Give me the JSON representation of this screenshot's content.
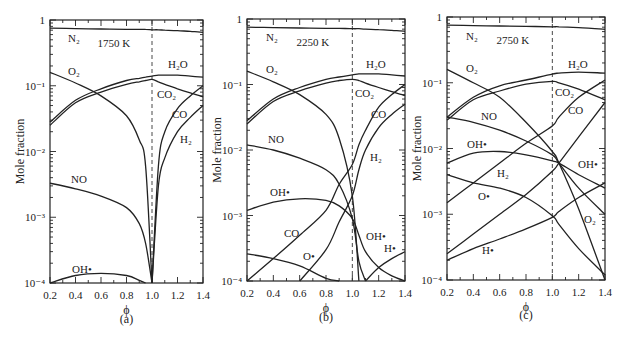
{
  "figure": {
    "ylabel": "Mole fraction",
    "xlabel": "ϕ",
    "yticks": [
      "1",
      "10⁻¹",
      "10⁻²",
      "10⁻³",
      "10⁻⁴"
    ],
    "xticks": [
      "0.2",
      "0.4",
      "0.6",
      "0.8",
      "1.0",
      "1.2",
      "1.4"
    ]
  },
  "chart_data": [
    {
      "type": "line",
      "panel": "(a)",
      "annotation": "1750 K",
      "xlabel": "ϕ",
      "ylabel": "Mole fraction",
      "xlim": [
        0.2,
        1.4
      ],
      "ylim": [
        0.0001,
        1
      ],
      "yscale": "log",
      "vline": 1.0,
      "x": [
        0.2,
        0.4,
        0.6,
        0.8,
        0.9,
        0.95,
        1.0,
        1.05,
        1.1,
        1.2,
        1.3,
        1.4
      ],
      "series": [
        {
          "name": "N2",
          "values": [
            0.75,
            0.74,
            0.73,
            0.72,
            0.72,
            0.72,
            0.71,
            0.71,
            0.7,
            0.69,
            0.67,
            0.65
          ]
        },
        {
          "name": "O2",
          "values": [
            0.16,
            0.11,
            0.07,
            0.035,
            0.015,
            0.006,
            0.0001,
            null,
            null,
            null,
            null,
            null
          ]
        },
        {
          "name": "H2O",
          "values": [
            0.028,
            0.06,
            0.09,
            0.12,
            0.13,
            0.135,
            0.14,
            0.145,
            0.145,
            0.145,
            0.14,
            0.135
          ]
        },
        {
          "name": "CO2",
          "values": [
            0.025,
            0.055,
            0.08,
            0.105,
            0.115,
            0.12,
            0.125,
            0.115,
            0.105,
            0.09,
            0.078,
            0.068
          ]
        },
        {
          "name": "CO",
          "values": [
            null,
            null,
            null,
            null,
            null,
            null,
            0.0001,
            0.006,
            0.02,
            0.045,
            0.07,
            0.1
          ]
        },
        {
          "name": "H2",
          "values": [
            null,
            null,
            null,
            null,
            null,
            null,
            0.0001,
            0.003,
            0.008,
            0.02,
            0.033,
            0.05
          ]
        },
        {
          "name": "NO",
          "values": [
            0.0033,
            0.0027,
            0.0021,
            0.0014,
            0.0008,
            0.0004,
            0.0001,
            null,
            null,
            null,
            null,
            null
          ]
        },
        {
          "name": "OH•",
          "values": [
            0.0001,
            0.00013,
            0.00014,
            0.00013,
            0.00011,
            0.0001,
            null,
            null,
            null,
            null,
            null,
            null
          ]
        }
      ]
    },
    {
      "type": "line",
      "panel": "(b)",
      "annotation": "2250 K",
      "xlabel": "ϕ",
      "ylabel": "Mole fraction",
      "xlim": [
        0.2,
        1.4
      ],
      "ylim": [
        0.0001,
        1
      ],
      "yscale": "log",
      "vline": 1.0,
      "x": [
        0.2,
        0.4,
        0.6,
        0.8,
        0.9,
        1.0,
        1.05,
        1.1,
        1.2,
        1.3,
        1.4
      ],
      "series": [
        {
          "name": "N2",
          "values": [
            0.75,
            0.74,
            0.73,
            0.72,
            0.72,
            0.71,
            0.71,
            0.7,
            0.69,
            0.67,
            0.65
          ]
        },
        {
          "name": "O2",
          "values": [
            0.16,
            0.11,
            0.07,
            0.035,
            0.015,
            0.002,
            0.0001,
            null,
            null,
            null,
            null
          ]
        },
        {
          "name": "H2O",
          "values": [
            0.028,
            0.06,
            0.09,
            0.12,
            0.13,
            0.14,
            0.145,
            0.145,
            0.145,
            0.14,
            0.135
          ]
        },
        {
          "name": "CO2",
          "values": [
            0.025,
            0.055,
            0.08,
            0.105,
            0.115,
            0.12,
            0.115,
            0.105,
            0.09,
            0.078,
            0.068
          ]
        },
        {
          "name": "CO",
          "values": [
            0.0001,
            0.00022,
            0.0005,
            0.0012,
            0.003,
            0.006,
            0.012,
            0.02,
            0.045,
            0.07,
            0.1
          ]
        },
        {
          "name": "H2",
          "values": [
            null,
            null,
            0.0001,
            0.0003,
            0.0008,
            0.002,
            0.005,
            0.01,
            0.022,
            0.035,
            0.05
          ]
        },
        {
          "name": "NO",
          "values": [
            0.012,
            0.01,
            0.0075,
            0.005,
            0.003,
            0.0009,
            0.0002,
            0.0001,
            null,
            null,
            null
          ]
        },
        {
          "name": "OH•",
          "values": [
            0.0012,
            0.0016,
            0.0018,
            0.0017,
            0.0014,
            0.0009,
            0.0005,
            0.00028,
            0.00016,
            0.00012,
            0.0001
          ]
        },
        {
          "name": "O•",
          "values": [
            0.00026,
            0.00022,
            0.00017,
            0.00011,
            8e-05,
            null,
            null,
            null,
            null,
            null,
            null
          ]
        },
        {
          "name": "H•",
          "values": [
            null,
            null,
            null,
            null,
            null,
            null,
            null,
            0.0001,
            0.00016,
            0.00022,
            0.00028
          ]
        }
      ]
    },
    {
      "type": "line",
      "panel": "(c)",
      "annotation": "2750 K",
      "xlabel": "ϕ",
      "ylabel": "Mole fraction",
      "xlim": [
        0.2,
        1.4
      ],
      "ylim": [
        0.0001,
        1
      ],
      "yscale": "log",
      "vline": 1.0,
      "x": [
        0.2,
        0.4,
        0.6,
        0.8,
        1.0,
        1.05,
        1.2,
        1.4
      ],
      "series": [
        {
          "name": "N2",
          "values": [
            0.75,
            0.74,
            0.73,
            0.72,
            0.71,
            0.71,
            0.69,
            0.65
          ]
        },
        {
          "name": "O2",
          "values": [
            0.16,
            0.1,
            0.06,
            0.025,
            0.009,
            0.006,
            0.0012,
            0.0001
          ]
        },
        {
          "name": "H2O",
          "values": [
            0.03,
            0.06,
            0.09,
            0.11,
            0.135,
            0.14,
            0.145,
            0.14
          ]
        },
        {
          "name": "CO2",
          "values": [
            0.027,
            0.055,
            0.075,
            0.095,
            0.105,
            0.1,
            0.08,
            0.055
          ]
        },
        {
          "name": "CO",
          "values": [
            0.0015,
            0.003,
            0.006,
            0.012,
            0.022,
            0.03,
            0.06,
            0.11
          ]
        },
        {
          "name": "H2",
          "values": [
            0.00025,
            0.0005,
            0.001,
            0.002,
            0.0045,
            0.006,
            0.015,
            0.05
          ]
        },
        {
          "name": "NO",
          "values": [
            0.03,
            0.025,
            0.019,
            0.013,
            0.008,
            0.006,
            0.0025,
            0.001
          ]
        },
        {
          "name": "OH•",
          "values": [
            0.006,
            0.0085,
            0.009,
            0.008,
            0.0065,
            0.006,
            0.004,
            0.0025
          ]
        },
        {
          "name": "O•",
          "values": [
            0.004,
            0.003,
            0.0025,
            0.0018,
            0.00095,
            0.0007,
            0.0003,
            0.00012
          ]
        },
        {
          "name": "H•",
          "values": [
            0.0002,
            0.0003,
            0.00042,
            0.0006,
            0.0009,
            0.0011,
            0.0018,
            0.003
          ]
        }
      ]
    }
  ],
  "panels": [
    {
      "caption": "(a)",
      "temp": "1750 K",
      "labels": {
        "N2": "N₂",
        "O2": "O₂",
        "H2O": "H₂O",
        "CO2": "CO₂",
        "CO": "CO",
        "H2": "H₂",
        "NO": "NO",
        "OH": "OH•"
      }
    },
    {
      "caption": "(b)",
      "temp": "2250 K",
      "labels": {
        "N2": "N₂",
        "O2": "O₂",
        "H2O": "H₂O",
        "CO2": "CO₂",
        "CO": "CO",
        "H2": "H₂",
        "NO": "NO",
        "OH": "OH•",
        "CO_low": "CO",
        "O": "O•",
        "OH_rich": "OH•",
        "H": "H•"
      }
    },
    {
      "caption": "(c)",
      "temp": "2750 K",
      "labels": {
        "N2": "N₂",
        "O2": "O₂",
        "H2O": "H₂O",
        "CO2": "CO₂",
        "CO": "CO",
        "H2": "H₂",
        "NO": "NO",
        "OH": "OH•",
        "O": "O•",
        "OH_rich": "OH•",
        "H": "H•",
        "O2_rich": "O₂"
      }
    }
  ]
}
